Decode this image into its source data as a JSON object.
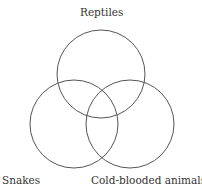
{
  "diagram": {
    "type": "venn",
    "stroke_color": "#555555",
    "sets": [
      {
        "id": "reptiles",
        "label": "Reptiles",
        "cx": 101,
        "cy": 74,
        "r": 44
      },
      {
        "id": "snakes",
        "label": "Snakes",
        "cx": 74,
        "cy": 124,
        "r": 44
      },
      {
        "id": "cold-blooded",
        "label": "Cold-blooded animals",
        "cx": 130,
        "cy": 124,
        "r": 44
      }
    ]
  }
}
